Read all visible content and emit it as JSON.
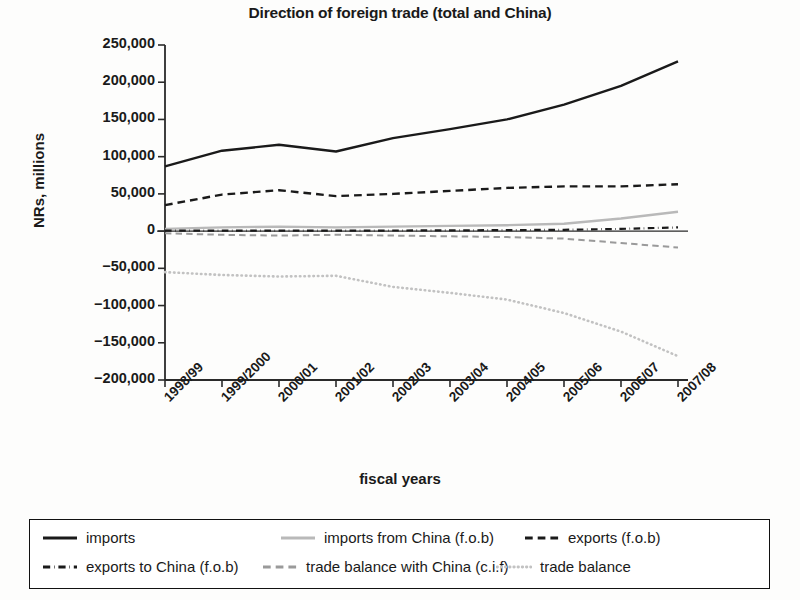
{
  "chart_data": {
    "type": "line",
    "title": "Direction of foreign trade (total and China)",
    "xlabel": "fiscal years",
    "ylabel": "NRs, millions",
    "categories": [
      "1998/99",
      "1999/2000",
      "2000/01",
      "2001/02",
      "2002/03",
      "2003/04",
      "2004/05",
      "2005/06",
      "2006/07",
      "2007/08"
    ],
    "ylim": [
      -200000,
      250000
    ],
    "ytick_labels": [
      "250,000",
      "200,000",
      "150,000",
      "100,000",
      "50,000",
      "0",
      "−50,000",
      "−100,000",
      "−150,000",
      "−200,000"
    ],
    "ytick_values": [
      250000,
      200000,
      150000,
      100000,
      50000,
      0,
      -50000,
      -100000,
      -150000,
      -200000
    ],
    "grid": false,
    "legend_position": "bottom",
    "series": [
      {
        "name": "imports",
        "style": "solid",
        "color": "#1a1a1a",
        "width": 2.4,
        "values": [
          87000,
          108000,
          116000,
          107000,
          125000,
          137000,
          150000,
          170000,
          195000,
          228000
        ]
      },
      {
        "name": "imports from China (f.o.b)",
        "style": "solid",
        "color": "#b9b9b9",
        "width": 2.4,
        "values": [
          3000,
          5000,
          6000,
          5000,
          6000,
          7000,
          8000,
          10000,
          17000,
          26000
        ]
      },
      {
        "name": "exports (f.o.b)",
        "style": "dashed",
        "color": "#1a1a1a",
        "width": 2.4,
        "values": [
          35000,
          49000,
          55000,
          47000,
          50000,
          54000,
          58000,
          60000,
          60000,
          63000
        ]
      },
      {
        "name": "exports to China (f.o.b)",
        "style": "dashdot",
        "color": "#1a1a1a",
        "width": 2.2,
        "values": [
          500,
          700,
          700,
          600,
          800,
          1000,
          1300,
          1800,
          3000,
          5000
        ]
      },
      {
        "name": "trade balance with China (c.i.f)",
        "style": "dashed",
        "color": "#9a9a9a",
        "width": 2.0,
        "values": [
          -3000,
          -5000,
          -6000,
          -5000,
          -6000,
          -7000,
          -8000,
          -10000,
          -16000,
          -22000
        ]
      },
      {
        "name": "trade balance",
        "style": "dotted",
        "color": "#c2c2c2",
        "width": 2.6,
        "values": [
          -55000,
          -59000,
          -61000,
          -60000,
          -75000,
          -83000,
          -92000,
          -110000,
          -135000,
          -168000
        ]
      }
    ]
  },
  "legend": {
    "items": [
      {
        "label": "imports",
        "swatch": "solid-black-line-icon"
      },
      {
        "label": "imports from China (f.o.b)",
        "swatch": "solid-gray-line-icon"
      },
      {
        "label": "exports (f.o.b)",
        "swatch": "dashed-black-line-icon"
      },
      {
        "label": "exports to China (f.o.b)",
        "swatch": "dashdot-black-line-icon"
      },
      {
        "label": "trade balance with China (c.i.f)",
        "swatch": "dashed-gray-line-icon"
      },
      {
        "label": "trade balance",
        "swatch": "dotted-gray-line-icon"
      }
    ]
  }
}
